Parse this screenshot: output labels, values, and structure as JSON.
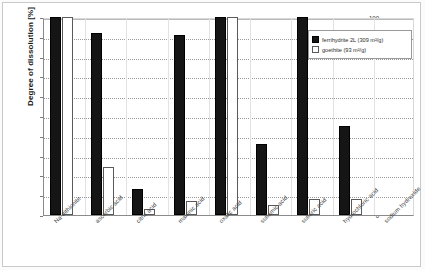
{
  "chart_data": {
    "type": "bar",
    "title": "",
    "subtitle": "",
    "xlabel": "",
    "ylabel": "Degree of dissolution [%]",
    "ylim": [
      0,
      100
    ],
    "yticks": [
      0,
      10,
      20,
      30,
      40,
      50,
      60,
      70,
      80,
      90,
      100
    ],
    "grid": true,
    "legend_position": "upper-right",
    "categories": [
      "Na-dithionite",
      "ascorbic acid",
      "citric acid",
      "malonic acid",
      "oxalic acid",
      "sulfamic acid",
      "sulfuric acid",
      "hydrochloric acid",
      "sodium hydroxide"
    ],
    "series": [
      {
        "name": "ferrihydrite 2L (309 m²/g)",
        "color": "#151515",
        "values": [
          100,
          92,
          13,
          91,
          100,
          36,
          100,
          45,
          0
        ]
      },
      {
        "name": "goethite (93 m²/g)",
        "color": "#ffffff",
        "values": [
          100,
          24,
          3,
          7,
          100,
          5,
          8,
          8,
          0
        ]
      }
    ]
  },
  "legend": {
    "entries": [
      {
        "label": "ferrihydrite 2L (309 m²/g)"
      },
      {
        "label": "goethite (93 m²/g)"
      }
    ]
  },
  "axis": {
    "y_title": "Degree of dissolution [%]"
  }
}
